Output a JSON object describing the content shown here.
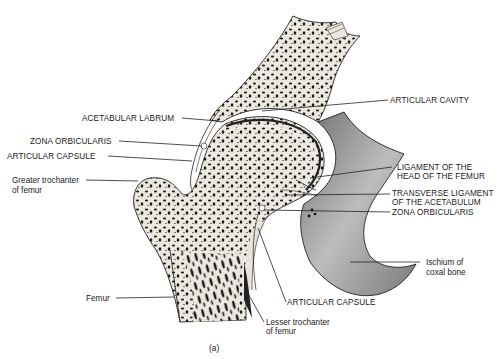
{
  "figure": {
    "caption": "(a)",
    "colors": {
      "background": "#ffffff",
      "bone_cortex": "#e8e4dc",
      "trabecular_dots": "#1a1a1a",
      "line": "#222222",
      "cartilage": "#f4f2ee",
      "ischium_shade": "#8a8a8a"
    }
  },
  "labels": {
    "acetabular_labrum": "ACETABULAR LABRUM",
    "zona_orbicularis_left": "ZONA ORBICULARIS",
    "articular_capsule_left": "ARTICULAR CAPSULE",
    "greater_trochanter_1": "Greater trochanter",
    "greater_trochanter_2": "of femur",
    "femur": "Femur",
    "articular_cavity": "ARTICULAR CAVITY",
    "ligament_head_1": "LIGAMENT OF THE",
    "ligament_head_2": "HEAD OF THE FEMUR",
    "transverse_1": "TRANSVERSE LIGAMENT",
    "transverse_2": "OF THE ACETABULUM",
    "zona_orbicularis_right": "ZONA ORBICULARIS",
    "ischium_1": "Ischium of",
    "ischium_2": "coxal bone",
    "articular_capsule_bottom": "ARTICULAR CAPSULE",
    "lesser_trochanter_1": "Lesser trochanter",
    "lesser_trochanter_2": "of femur"
  }
}
